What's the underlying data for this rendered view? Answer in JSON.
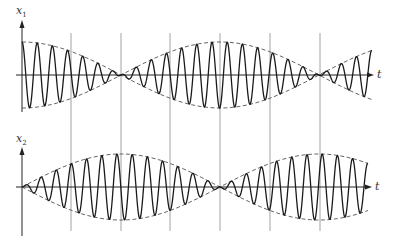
{
  "figure": {
    "type": "beat-oscillation-diagram",
    "colors": {
      "signal": "#1a1a1a",
      "envelope": "#555555",
      "axis": "#222222",
      "grid": "#8a8a8a",
      "background": "#ffffff"
    },
    "time_axis_label": "t",
    "grid_x": [
      71,
      121,
      170,
      220,
      270,
      320
    ],
    "plots": [
      {
        "name": "x1",
        "label": "x",
        "label_sub": "1",
        "label_pos": [
          16,
          5
        ],
        "axis_x": 22,
        "zero_y": 75,
        "amplitude": 33,
        "axis_top": 20,
        "axis_bottom": 112,
        "grid_top": 33,
        "grid_bottom": 120,
        "t_start": 22,
        "t_end": 372,
        "arrow_end": 374,
        "t_label_pos": [
          377,
          69
        ],
        "envelope": "cos",
        "carrier": "cos"
      },
      {
        "name": "x2",
        "label": "x",
        "label_sub": "2",
        "label_pos": [
          16,
          133
        ],
        "axis_x": 22,
        "zero_y": 187,
        "amplitude": 33,
        "axis_top": 147,
        "axis_bottom": 236,
        "grid_top": 120,
        "grid_bottom": 231,
        "t_start": 22,
        "t_end": 368,
        "arrow_end": 372,
        "t_label_pos": [
          375,
          181
        ],
        "envelope": "sin",
        "carrier": "sin"
      }
    ],
    "envelope_half_period_px": 99,
    "carrier_period_px": 15.2
  }
}
